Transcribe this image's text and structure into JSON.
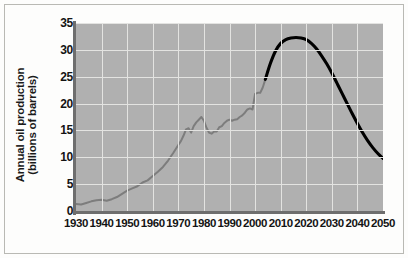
{
  "chart_data": {
    "type": "line",
    "title": "",
    "xlabel": "",
    "ylabel_line1": "Annual oil production",
    "ylabel_line2": "(billions of barrels)",
    "xlim": [
      1930,
      2050
    ],
    "ylim": [
      0,
      35
    ],
    "grid": true,
    "legend": "none",
    "y_ticks": [
      0,
      5,
      10,
      15,
      20,
      25,
      30,
      35
    ],
    "x_ticks": [
      1930,
      1940,
      1950,
      1960,
      1970,
      1980,
      1990,
      2000,
      2010,
      2020,
      2030,
      2040,
      2050
    ],
    "colors": {
      "historical_line": "#7d7d7d",
      "projection_line": "#000000",
      "plot_background": "#b0b0b0",
      "gridline": "#e3e3e1",
      "axis": "#6e6e6e",
      "text": "#141414",
      "page_background": "#fdfdfc",
      "frame_border": "#b9b9b4"
    },
    "series": [
      {
        "name": "Historical annual oil production",
        "style": "solid-gray",
        "x": [
          1930,
          1932,
          1934,
          1936,
          1938,
          1940,
          1942,
          1944,
          1946,
          1948,
          1950,
          1952,
          1954,
          1956,
          1958,
          1960,
          1962,
          1964,
          1966,
          1968,
          1970,
          1971,
          1972,
          1973,
          1974,
          1975,
          1976,
          1977,
          1978,
          1979,
          1980,
          1981,
          1982,
          1983,
          1984,
          1985,
          1986,
          1987,
          1988,
          1989,
          1990,
          1991,
          1992,
          1993,
          1994,
          1995,
          1996,
          1997,
          1998,
          1999,
          2000,
          2001,
          2002,
          2003,
          2004
        ],
        "y": [
          1.3,
          1.2,
          1.5,
          1.8,
          2.0,
          2.1,
          1.9,
          2.2,
          2.6,
          3.2,
          3.8,
          4.2,
          4.6,
          5.3,
          5.7,
          6.5,
          7.3,
          8.2,
          9.4,
          10.8,
          12.3,
          13.0,
          14.0,
          15.2,
          15.4,
          14.6,
          15.8,
          16.5,
          17.0,
          17.5,
          16.8,
          15.5,
          14.6,
          14.4,
          14.8,
          14.8,
          15.6,
          15.8,
          16.4,
          16.8,
          17.0,
          16.8,
          17.0,
          17.1,
          17.5,
          17.8,
          18.3,
          18.9,
          19.1,
          18.9,
          21.8,
          22.0,
          22.0,
          23.0,
          24.5
        ]
      },
      {
        "name": "Projected annual oil production",
        "style": "solid-black",
        "x": [
          2004,
          2006,
          2008,
          2010,
          2012,
          2014,
          2016,
          2018,
          2020,
          2022,
          2024,
          2026,
          2028,
          2030,
          2032,
          2034,
          2036,
          2038,
          2040,
          2042,
          2044,
          2046,
          2048,
          2050
        ],
        "y": [
          24.5,
          27.5,
          29.8,
          31.2,
          31.9,
          32.2,
          32.3,
          32.2,
          31.9,
          31.2,
          30.2,
          28.9,
          27.4,
          25.7,
          23.8,
          21.9,
          20.0,
          18.1,
          16.3,
          14.6,
          13.1,
          11.8,
          10.7,
          9.8
        ]
      }
    ]
  }
}
